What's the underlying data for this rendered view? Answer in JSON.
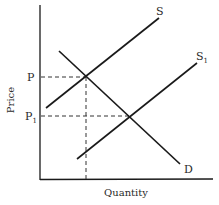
{
  "diagram": {
    "type": "supply-demand-shift",
    "axes": {
      "y_label": "Price",
      "x_label": "Quantity"
    },
    "curves": [
      {
        "id": "S",
        "label": "S",
        "kind": "supply"
      },
      {
        "id": "S1",
        "label": "S",
        "subscript": "1",
        "kind": "supply-shifted"
      },
      {
        "id": "D",
        "label": "D",
        "kind": "demand"
      }
    ],
    "price_levels": [
      {
        "id": "P",
        "label": "P"
      },
      {
        "id": "P1",
        "label": "P",
        "subscript": "1"
      }
    ],
    "colors": {
      "line": "#1a1a1a",
      "text": "#2a2a2a",
      "background": "#ffffff"
    }
  }
}
